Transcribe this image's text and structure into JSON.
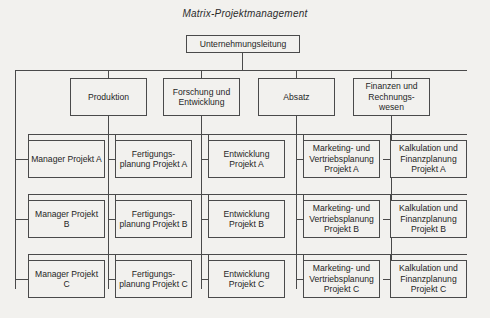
{
  "title": "Matrix-Projektmanagement",
  "top": {
    "label": "Unternehmungsleitung"
  },
  "departments": [
    {
      "label": "Produktion"
    },
    {
      "label": "Forschung und Entwicklung"
    },
    {
      "label": "Absatz"
    },
    {
      "label": "Finanzen und Rechnungs-wesen"
    }
  ],
  "projects": [
    {
      "manager": "Manager Projekt A",
      "cells": [
        "Fertigungs-planung Projekt A",
        "Entwicklung Projekt A",
        "Marketing- und Vertriebsplanung Projekt A",
        "Kalkulation und Finanzplanung Projekt A"
      ]
    },
    {
      "manager": "Manager Projekt B",
      "cells": [
        "Fertigungs-planung Projekt B",
        "Entwicklung Projekt B",
        "Marketing- und Vertriebsplanung Projekt B",
        "Kalkulation und Finanzplanung Projekt B"
      ]
    },
    {
      "manager": "Manager Projekt C",
      "cells": [
        "Fertigungs-planung Projekt C",
        "Entwicklung Projekt C",
        "Marketing- und Vertriebsplanung Projekt C",
        "Kalkulation und Finanzplanung Projekt C"
      ]
    }
  ],
  "colors": {
    "background": "#f2f1ee",
    "line": "#4a4a4a",
    "text": "#1f1f1f"
  }
}
